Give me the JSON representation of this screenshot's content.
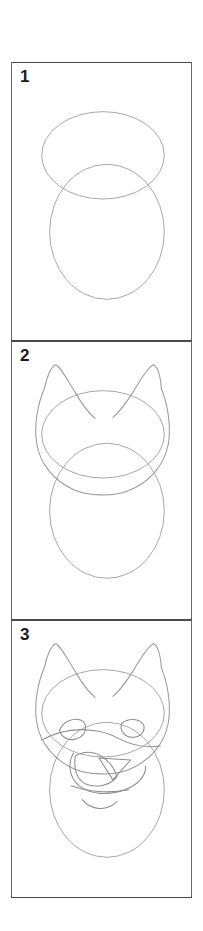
{
  "document": {
    "type": "step-by-step-drawing-tutorial",
    "subject": "cat head",
    "background_color": "#ffffff",
    "panel_border_color": "#4a4a4a",
    "construction_line_color": "#a8a8a8",
    "outline_color": "#9a9a9a",
    "feature_line_color": "#8d8d8d",
    "number_color": "#1a1a1a"
  },
  "panels": [
    {
      "number": "1",
      "name": "step-1",
      "description": "Two overlapping ellipses: a wide horizontal ellipse on top and a taller vertical ellipse below",
      "shapes": [
        {
          "name": "upper-ellipse",
          "type": "ellipse",
          "cx": 103,
          "cy": 100,
          "rx": 62,
          "ry": 44
        },
        {
          "name": "lower-ellipse",
          "type": "ellipse",
          "cx": 107,
          "cy": 177,
          "rx": 58,
          "ry": 68
        }
      ]
    },
    {
      "number": "2",
      "name": "step-2",
      "description": "Same two guide ellipses with a cat head outline and two pointed ears added",
      "shapes": [
        {
          "name": "upper-ellipse",
          "type": "ellipse",
          "cx": 103,
          "cy": 100,
          "rx": 62,
          "ry": 44
        },
        {
          "name": "lower-ellipse",
          "type": "ellipse",
          "cx": 107,
          "cy": 177,
          "rx": 58,
          "ry": 68
        },
        {
          "name": "head-outline",
          "type": "path"
        },
        {
          "name": "left-ear",
          "type": "path"
        },
        {
          "name": "right-ear",
          "type": "path"
        }
      ]
    },
    {
      "number": "3",
      "name": "step-3",
      "description": "Head and ears with facial features: two almond eyes, brow line, triangular nose, curved muzzle and mouth",
      "shapes": [
        {
          "name": "upper-ellipse",
          "type": "ellipse",
          "cx": 103,
          "cy": 100,
          "rx": 62,
          "ry": 44
        },
        {
          "name": "lower-ellipse",
          "type": "ellipse",
          "cx": 107,
          "cy": 177,
          "rx": 58,
          "ry": 68
        },
        {
          "name": "head-outline",
          "type": "path"
        },
        {
          "name": "left-ear",
          "type": "path"
        },
        {
          "name": "right-ear",
          "type": "path"
        },
        {
          "name": "left-eye",
          "type": "path"
        },
        {
          "name": "right-eye",
          "type": "path"
        },
        {
          "name": "brow-line",
          "type": "path"
        },
        {
          "name": "nose",
          "type": "path"
        },
        {
          "name": "muzzle",
          "type": "path"
        },
        {
          "name": "mouth",
          "type": "path"
        }
      ]
    }
  ]
}
